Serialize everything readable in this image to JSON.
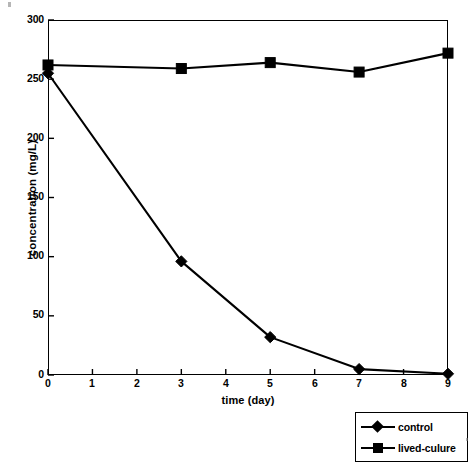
{
  "chart_data": {
    "type": "line",
    "title": "",
    "xlabel": "time (day)",
    "ylabel": "concentration (mg/L)",
    "xlim": [
      0,
      9
    ],
    "ylim": [
      0,
      300
    ],
    "xticks": [
      0,
      1,
      2,
      3,
      4,
      5,
      6,
      7,
      8,
      9
    ],
    "xtick_labels": [
      "0",
      "1",
      "2",
      "3",
      "4",
      "5",
      "6",
      "7",
      "8",
      "9"
    ],
    "yticks": [
      0,
      50,
      100,
      150,
      200,
      250,
      300
    ],
    "ytick_labels": [
      "0",
      "50",
      "100",
      "150",
      "200",
      "250",
      "300"
    ],
    "grid": false,
    "legend_position": "below-right",
    "line_color": "#000000",
    "series": [
      {
        "name": "control",
        "marker": "diamond",
        "color": "#000000",
        "x": [
          0,
          3,
          5,
          7,
          9
        ],
        "values": [
          255,
          96,
          32,
          5,
          1
        ]
      },
      {
        "name": "lived-culure",
        "marker": "square",
        "color": "#000000",
        "x": [
          0,
          3,
          5,
          7,
          9
        ],
        "values": [
          262,
          259,
          264,
          256,
          272
        ]
      }
    ]
  },
  "axes": {
    "x_title": "time (day)",
    "y_title": "concentration (mg/L)",
    "x_tick_labels": [
      "0",
      "1",
      "2",
      "3",
      "4",
      "5",
      "6",
      "7",
      "8",
      "9"
    ],
    "y_tick_labels": [
      "300",
      "250",
      "200",
      "150",
      "100",
      "50",
      "0"
    ]
  },
  "legend": {
    "entries": [
      {
        "label": "control",
        "marker": "diamond"
      },
      {
        "label": "lived-culure",
        "marker": "square"
      }
    ]
  }
}
